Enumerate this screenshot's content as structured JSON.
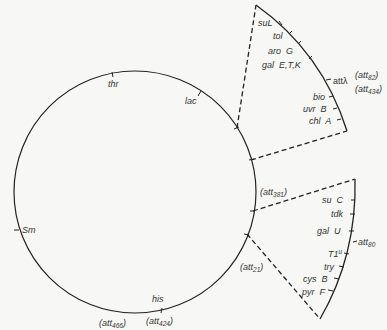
{
  "diagram": {
    "colors": {
      "line": "#222222",
      "text": "#333333",
      "background": "#f7f7f5"
    },
    "circle_markers": [
      {
        "label": "thr"
      },
      {
        "label": "lac"
      },
      {
        "label": "Sm"
      },
      {
        "label": "his"
      }
    ],
    "circle_att_labels": {
      "att381": "(att",
      "att381_sub": "381",
      "att21": "(att",
      "att21_sub": "21",
      "att466": "(att",
      "att466_sub": "466",
      "att424": "(att",
      "att424_sub": "424",
      "close": ")"
    },
    "upper_segment": {
      "markers": [
        "suL",
        "tol",
        "aro  G",
        "gal  E,T,K",
        "bio",
        "uvr  B",
        "chl  A"
      ],
      "att_lambda": "attλ",
      "att82": "(att",
      "att82_sub": "82",
      "att434": "(att",
      "att434_sub": "434",
      "close": ")"
    },
    "lower_segment": {
      "markers": [
        "su  C",
        "tdk",
        "gal  U",
        "T1",
        "try",
        "cys  B",
        "pyr  F"
      ],
      "T1_sup": "u",
      "att80": "att",
      "att80_sub": "80"
    }
  }
}
